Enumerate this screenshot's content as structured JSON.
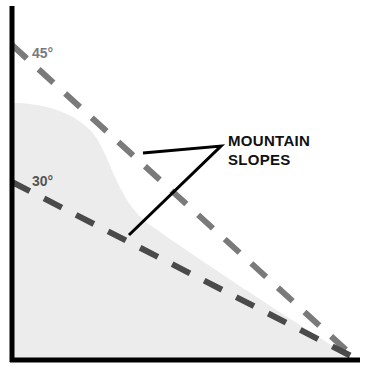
{
  "diagram": {
    "labels": {
      "angle_45": "45°",
      "angle_30": "30°",
      "callout_line1": "MOUNTAIN",
      "callout_line2": "SLOPES"
    },
    "colors": {
      "axis": "#000000",
      "slope_45": "#7a7a7a",
      "slope_30": "#4a4a4a",
      "mountain_fill": "#ededed",
      "callout_line": "#000000"
    }
  }
}
